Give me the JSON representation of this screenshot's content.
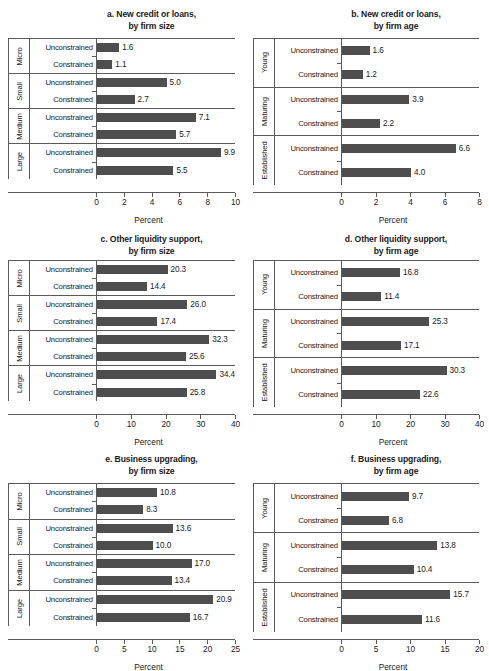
{
  "figure": {
    "background": "#ffffff",
    "bar_color": "#4e4e4e",
    "axis_color": "#5a5a5a",
    "xlabel": "Percent",
    "series_labels": [
      "Unconstrained",
      "Constrained"
    ]
  },
  "chart_data": [
    {
      "id": "a",
      "type": "bar",
      "orientation": "horizontal",
      "title": "a. New credit or loans,",
      "subtitle": "by firm size",
      "xlabel": "Percent",
      "ylabel": "",
      "grid": false,
      "legend": "none",
      "xlim": [
        0,
        10
      ],
      "xticks": [
        0,
        2,
        4,
        6,
        8,
        10
      ],
      "xticklabels": [
        "0",
        "2",
        "4",
        "6",
        "8",
        "10"
      ],
      "groups": [
        "Micro",
        "Small",
        "Medium",
        "Large"
      ],
      "categories": [
        "Unconstrained",
        "Constrained"
      ],
      "values": [
        [
          1.6,
          1.1
        ],
        [
          5.0,
          2.7
        ],
        [
          7.1,
          5.7
        ],
        [
          9.9,
          5.5
        ]
      ],
      "value_labels": [
        [
          "1.6",
          "1.1"
        ],
        [
          "5.0",
          "2.7"
        ],
        [
          "7.1",
          "5.7"
        ],
        [
          "9.9",
          "5.5"
        ]
      ]
    },
    {
      "id": "b",
      "type": "bar",
      "orientation": "horizontal",
      "title": "b. New credit or loans,",
      "subtitle": "by firm age",
      "xlabel": "Percent",
      "ylabel": "",
      "grid": false,
      "legend": "none",
      "xlim": [
        0,
        8
      ],
      "xticks": [
        0,
        2,
        4,
        6,
        8
      ],
      "xticklabels": [
        "0",
        "2",
        "4",
        "6",
        "8"
      ],
      "groups": [
        "Young",
        "Maturing",
        "Established"
      ],
      "categories": [
        "Unconstrained",
        "Constrained"
      ],
      "values": [
        [
          1.6,
          1.2
        ],
        [
          3.9,
          2.2
        ],
        [
          6.6,
          4.0
        ]
      ],
      "value_labels": [
        [
          "1.6",
          "1.2"
        ],
        [
          "3.9",
          "2.2"
        ],
        [
          "6.6",
          "4.0"
        ]
      ]
    },
    {
      "id": "c",
      "type": "bar",
      "orientation": "horizontal",
      "title": "c. Other liquidity support,",
      "subtitle": "by firm size",
      "xlabel": "Percent",
      "ylabel": "",
      "grid": false,
      "legend": "none",
      "xlim": [
        0,
        40
      ],
      "xticks": [
        0,
        10,
        20,
        30,
        40
      ],
      "xticklabels": [
        "0",
        "10",
        "20",
        "30",
        "40"
      ],
      "groups": [
        "Micro",
        "Small",
        "Medium",
        "Large"
      ],
      "categories": [
        "Unconstrained",
        "Constrained"
      ],
      "values": [
        [
          20.3,
          14.4
        ],
        [
          26.0,
          17.4
        ],
        [
          32.3,
          25.6
        ],
        [
          34.4,
          25.8
        ]
      ],
      "value_labels": [
        [
          "20.3",
          "14.4"
        ],
        [
          "26.0",
          "17.4"
        ],
        [
          "32.3",
          "25.6"
        ],
        [
          "34.4",
          "25.8"
        ]
      ]
    },
    {
      "id": "d",
      "type": "bar",
      "orientation": "horizontal",
      "title": "d. Other liquidity support,",
      "subtitle": "by firm age",
      "xlabel": "Percent",
      "ylabel": "",
      "grid": false,
      "legend": "none",
      "xlim": [
        0,
        40
      ],
      "xticks": [
        0,
        10,
        20,
        30,
        40
      ],
      "xticklabels": [
        "0",
        "10",
        "20",
        "30",
        "40"
      ],
      "groups": [
        "Young",
        "Maturing",
        "Established"
      ],
      "categories": [
        "Unconstrained",
        "Constrained"
      ],
      "values": [
        [
          16.8,
          11.4
        ],
        [
          25.3,
          17.1
        ],
        [
          30.3,
          22.6
        ]
      ],
      "value_labels": [
        [
          "16.8",
          "11.4"
        ],
        [
          "25.3",
          "17.1"
        ],
        [
          "30.3",
          "22.6"
        ]
      ]
    },
    {
      "id": "e",
      "type": "bar",
      "orientation": "horizontal",
      "title": "e. Business upgrading,",
      "subtitle": "by firm size",
      "xlabel": "Percent",
      "ylabel": "",
      "grid": false,
      "legend": "none",
      "xlim": [
        0,
        25
      ],
      "xticks": [
        0,
        5,
        10,
        15,
        20,
        25
      ],
      "xticklabels": [
        "0",
        "5",
        "10",
        "15",
        "20",
        "25"
      ],
      "groups": [
        "Micro",
        "Small",
        "Medium",
        "Large"
      ],
      "categories": [
        "Unconstrained",
        "Constrained"
      ],
      "values": [
        [
          10.8,
          8.3
        ],
        [
          13.6,
          10.0
        ],
        [
          17.0,
          13.4
        ],
        [
          20.9,
          16.7
        ]
      ],
      "value_labels": [
        [
          "10.8",
          "8.3"
        ],
        [
          "13.6",
          "10.0"
        ],
        [
          "17.0",
          "13.4"
        ],
        [
          "20.9",
          "16.7"
        ]
      ]
    },
    {
      "id": "f",
      "type": "bar",
      "orientation": "horizontal",
      "title": "f. Business upgrading,",
      "subtitle": "by firm age",
      "xlabel": "Percent",
      "ylabel": "",
      "grid": false,
      "legend": "none",
      "xlim": [
        0,
        20
      ],
      "xticks": [
        0,
        5,
        10,
        15,
        20
      ],
      "xticklabels": [
        "0",
        "5",
        "10",
        "15",
        "20"
      ],
      "groups": [
        "Young",
        "Maturing",
        "Established"
      ],
      "categories": [
        "Unconstrained",
        "Constrained"
      ],
      "values": [
        [
          9.7,
          6.8
        ],
        [
          13.8,
          10.4
        ],
        [
          15.7,
          11.6
        ]
      ],
      "value_labels": [
        [
          "9.7",
          "6.8"
        ],
        [
          "13.8",
          "10.4"
        ],
        [
          "15.7",
          "11.6"
        ]
      ]
    }
  ]
}
